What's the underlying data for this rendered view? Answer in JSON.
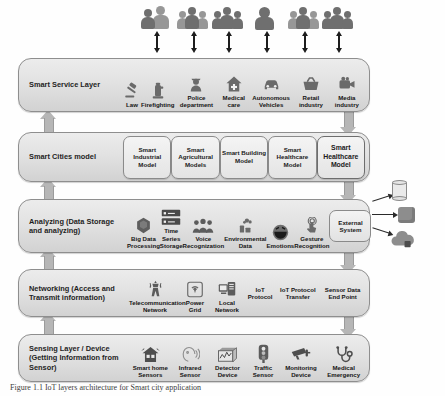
{
  "figure": {
    "caption": "Figure 1.1 IoT layers architecture for Smart city application"
  },
  "actors": {
    "label": "stakeholders",
    "count": 6,
    "items": [
      {
        "name": "actor-group-1",
        "icon": "people-icon"
      },
      {
        "name": "actor-group-2",
        "icon": "people-icon"
      },
      {
        "name": "actor-group-3",
        "icon": "people-icon"
      },
      {
        "name": "actor-group-4",
        "icon": "person-icon"
      },
      {
        "name": "actor-group-5",
        "icon": "people-icon"
      },
      {
        "name": "actor-group-6",
        "icon": "people-icon"
      }
    ]
  },
  "layers": {
    "service": {
      "title": "Smart Service Layer",
      "items": [
        {
          "label": "Law",
          "icon": "gavel-icon"
        },
        {
          "label": "Firefighting",
          "icon": "fire-hydrant-icon"
        },
        {
          "label": "Police department",
          "icon": "police-officer-icon"
        },
        {
          "label": "Medical care",
          "icon": "medical-house-icon"
        },
        {
          "label": "Autonomous Vehicles",
          "icon": "car-icon"
        },
        {
          "label": "Retail industry",
          "icon": "shopping-basket-icon"
        },
        {
          "label": "Media industry",
          "icon": "video-camera-icon"
        }
      ]
    },
    "cities": {
      "title": "Smart Cities model",
      "items": [
        {
          "label": "Smart Industrial Model",
          "emphasis": false
        },
        {
          "label": "Smart Agricultural Models",
          "emphasis": false
        },
        {
          "label": "Smart Building Model",
          "emphasis": false
        },
        {
          "label": "Smart Healthcare Model",
          "emphasis": false
        },
        {
          "label": "Smart Healthcare Model",
          "emphasis": true
        }
      ]
    },
    "analyzing": {
      "title": "Analyzing (Data Storage and analyzing)",
      "items": [
        {
          "label": "Big Data Processing",
          "icon": "hexagon-database-icon"
        },
        {
          "label": "Time Series Storage",
          "icon": "server-rack-icon"
        },
        {
          "label": "Voice Recognization",
          "icon": "crowd-voice-icon"
        },
        {
          "label": "Environmental Data",
          "icon": "factory-emission-icon"
        },
        {
          "label": "Emotions",
          "icon": "smiley-face-icon"
        },
        {
          "label": "Gesture Recognition",
          "icon": "hand-touch-icon"
        }
      ],
      "external_box": "External System"
    },
    "networking": {
      "title": "Networking (Access and Transmit information)",
      "items": [
        {
          "label": "Telecommunication Network",
          "icon": "radio-tower-icon"
        },
        {
          "label": "Power Grid",
          "icon": "wifi-signal-icon"
        },
        {
          "label": "Local Network",
          "icon": "computer-network-icon"
        },
        {
          "label": "IoT Protocol",
          "icon": "none"
        },
        {
          "label": "IoT Protocol Transfer",
          "icon": "none"
        },
        {
          "label": "Sensor Data End Point",
          "icon": "none"
        }
      ]
    },
    "sensing": {
      "title": "Sensing Layer / Device (Getting Information from Sensor)",
      "items": [
        {
          "label": "Smart home Sensors",
          "icon": "smart-home-icon"
        },
        {
          "label": "Infrared Sensor",
          "icon": "face-scan-icon"
        },
        {
          "label": "Detector Device",
          "icon": "detector-box-icon"
        },
        {
          "label": "Traffic Sensor",
          "icon": "traffic-light-icon"
        },
        {
          "label": "Monitoring Device",
          "icon": "cctv-camera-icon"
        },
        {
          "label": "Medical Emergency",
          "icon": "stethoscope-icon"
        }
      ]
    }
  },
  "external_targets": [
    {
      "label": "",
      "icon": "database-cylinder-icon"
    },
    {
      "label": "",
      "icon": "server-cube-icon"
    },
    {
      "label": "",
      "icon": "cloud-storage-icon"
    }
  ],
  "colors": {
    "bar_fill": "#e2e2e2",
    "bar_border": "#8e8e8e",
    "arrow_gray": "#b6b6b6",
    "icon_gray": "#6f6f6f",
    "text": "#1e1e1e"
  }
}
